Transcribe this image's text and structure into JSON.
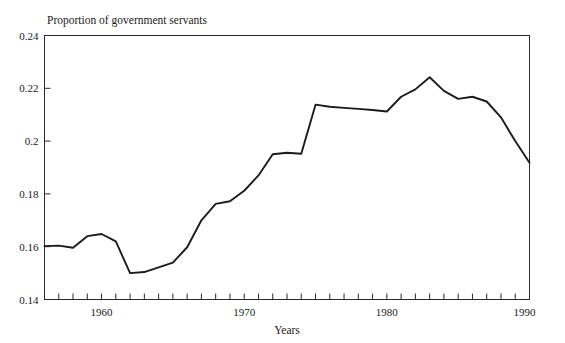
{
  "chart_data": {
    "type": "line",
    "title": "Proportion of government servants",
    "xlabel": "Years",
    "ylabel": "",
    "xlim": [
      1956,
      1990
    ],
    "ylim": [
      0.14,
      0.24
    ],
    "grid": false,
    "legend": "none",
    "x_ticks_major": [
      1960,
      1970,
      1980,
      1990
    ],
    "x_tick_labels": [
      "1960",
      "1970",
      "1980",
      "1990"
    ],
    "x_minor_tick_step": 1,
    "y_ticks": [
      0.14,
      0.16,
      0.18,
      0.2,
      0.22,
      0.24
    ],
    "y_tick_labels": [
      "0.14",
      "0.16",
      "0.18",
      "0.2",
      "0.22",
      "0.24"
    ],
    "line_color": "#1c1c1c",
    "series": [
      {
        "name": "Proportion of government servants",
        "x": [
          1956,
          1957,
          1958,
          1959,
          1960,
          1961,
          1962,
          1963,
          1964,
          1965,
          1966,
          1967,
          1968,
          1969,
          1970,
          1971,
          1972,
          1973,
          1974,
          1975,
          1976,
          1977,
          1978,
          1979,
          1980,
          1981,
          1982,
          1983,
          1984,
          1985,
          1986,
          1987,
          1988,
          1989,
          1990
        ],
        "values": [
          0.1602,
          0.1604,
          0.1596,
          0.164,
          0.1648,
          0.162,
          0.15,
          0.1504,
          0.1522,
          0.154,
          0.1598,
          0.17,
          0.1762,
          0.1772,
          0.1812,
          0.187,
          0.195,
          0.1956,
          0.1952,
          0.2138,
          0.213,
          0.2126,
          0.2122,
          0.2118,
          0.2112,
          0.2168,
          0.2196,
          0.2242,
          0.219,
          0.216,
          0.2168,
          0.215,
          0.209,
          0.2,
          0.1918
        ]
      }
    ]
  },
  "labels": {
    "title": "Proportion of government servants",
    "xlabel": "Years"
  }
}
